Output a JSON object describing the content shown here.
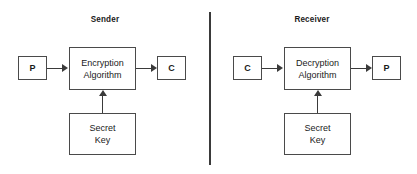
{
  "diagram": {
    "type": "block-diagram",
    "background_color": "#ffffff",
    "line_color": "#3a3a3a",
    "border_color": "#4a4a4a",
    "text_color": "#1a1a1a"
  },
  "divider": {
    "name": "vertical-divider"
  },
  "sender": {
    "title": "Sender",
    "input": {
      "label": "P",
      "meaning": "plaintext"
    },
    "process": {
      "line1": "Encryption",
      "line2": "Algorithm"
    },
    "output": {
      "label": "C",
      "meaning": "ciphertext"
    },
    "key": {
      "line1": "Secret",
      "line2": "Key"
    }
  },
  "receiver": {
    "title": "Receiver",
    "input": {
      "label": "C",
      "meaning": "ciphertext"
    },
    "process": {
      "line1": "Decryption",
      "line2": "Algorithm"
    },
    "output": {
      "label": "P",
      "meaning": "plaintext"
    },
    "key": {
      "line1": "Secret",
      "line2": "Key"
    }
  }
}
